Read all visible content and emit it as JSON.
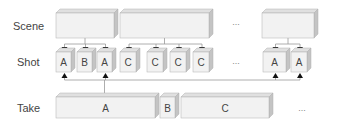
{
  "rows": {
    "scene": "Scene",
    "shot": "Shot",
    "take": "Take"
  },
  "scenes": [
    {
      "id": "scene-1",
      "label": ""
    },
    {
      "id": "scene-2",
      "label": ""
    },
    {
      "id": "scene-n",
      "label": ""
    }
  ],
  "shots": [
    {
      "label": "A",
      "scene": 0,
      "take": 0
    },
    {
      "label": "B",
      "scene": 0,
      "take": 1
    },
    {
      "label": "A",
      "scene": 0,
      "take": 0
    },
    {
      "label": "C",
      "scene": 1,
      "take": 2
    },
    {
      "label": "C",
      "scene": 1,
      "take": 2
    },
    {
      "label": "C",
      "scene": 1,
      "take": 2
    },
    {
      "label": "C",
      "scene": 1,
      "take": 2
    },
    {
      "label": "A",
      "scene": 2,
      "take": 0
    },
    {
      "label": "A",
      "scene": 2,
      "take": 0
    }
  ],
  "takes": [
    {
      "label": "A"
    },
    {
      "label": "B"
    },
    {
      "label": "C"
    }
  ],
  "ellipsis": "...",
  "colors": {
    "front": "#f2f2f2",
    "top": "#e0e0e0",
    "side": "#c4c4c4",
    "edge": "#b0b0b0",
    "line": "#999999",
    "arrow": "#111111"
  }
}
